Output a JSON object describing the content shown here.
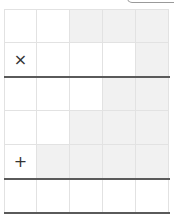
{
  "board": {
    "columns": 5,
    "rows": 6,
    "colors": {
      "cell": "#ffffff",
      "shaded_cell": "#f1f1f1",
      "grid_line": "#e2e2e2",
      "divider": "#5a5a5a",
      "mark": "#333333"
    },
    "cells": [
      [
        {
          "mark": "",
          "shaded": false
        },
        {
          "mark": "",
          "shaded": false
        },
        {
          "mark": "",
          "shaded": true
        },
        {
          "mark": "",
          "shaded": true
        },
        {
          "mark": "",
          "shaded": true
        }
      ],
      [
        {
          "mark": "×",
          "shaded": false
        },
        {
          "mark": "",
          "shaded": false
        },
        {
          "mark": "",
          "shaded": false
        },
        {
          "mark": "",
          "shaded": false
        },
        {
          "mark": "",
          "shaded": true
        }
      ],
      [
        {
          "mark": "",
          "shaded": false
        },
        {
          "mark": "",
          "shaded": false
        },
        {
          "mark": "",
          "shaded": false
        },
        {
          "mark": "",
          "shaded": true
        },
        {
          "mark": "",
          "shaded": true
        }
      ],
      [
        {
          "mark": "",
          "shaded": false
        },
        {
          "mark": "",
          "shaded": false
        },
        {
          "mark": "",
          "shaded": true
        },
        {
          "mark": "",
          "shaded": true
        },
        {
          "mark": "",
          "shaded": true
        }
      ],
      [
        {
          "mark": "+",
          "shaded": false
        },
        {
          "mark": "",
          "shaded": true
        },
        {
          "mark": "",
          "shaded": true
        },
        {
          "mark": "",
          "shaded": true
        },
        {
          "mark": "",
          "shaded": true
        }
      ],
      [
        {
          "mark": "",
          "shaded": false
        },
        {
          "mark": "",
          "shaded": false
        },
        {
          "mark": "",
          "shaded": false
        },
        {
          "mark": "",
          "shaded": false
        },
        {
          "mark": "",
          "shaded": false
        }
      ]
    ],
    "dividers_after_rows": [
      1,
      4,
      5
    ]
  }
}
